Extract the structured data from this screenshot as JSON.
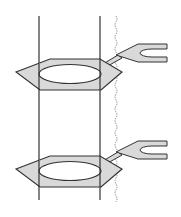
{
  "diagram": {
    "colors": {
      "stroke": "#333333",
      "fill": "#d9d9d9",
      "background": "#ffffff",
      "wavy": "#777777"
    },
    "units": [
      {
        "id": "upper",
        "offset_y": 0
      },
      {
        "id": "lower",
        "offset_y": 97
      }
    ]
  }
}
